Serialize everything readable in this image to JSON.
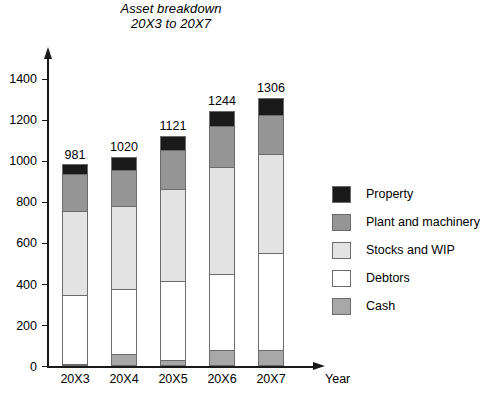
{
  "chart_data": {
    "type": "bar",
    "subtype": "stacked-bar",
    "title": "Asset breakdown\n20X3 to 20X7",
    "title_lines": [
      "Asset breakdown",
      "20X3 to 20X7"
    ],
    "xlabel": "Year",
    "ylabel": "",
    "categories": [
      "20X3",
      "20X4",
      "20X5",
      "20X6",
      "20X7"
    ],
    "ylim": [
      0,
      1500
    ],
    "yticks": [
      0,
      200,
      400,
      600,
      800,
      1000,
      1200,
      1400
    ],
    "ytick_labels": [
      "0",
      "200",
      "400",
      "600",
      "800",
      "1000",
      "1200",
      "1400"
    ],
    "grid": false,
    "legend_position": "right",
    "stack_order_bottom_to_top": [
      "Cash",
      "Debtors",
      "Stocks and WIP",
      "Plant and machinery",
      "Property"
    ],
    "series": [
      {
        "name": "Cash",
        "color": "#a8a8a8",
        "values": [
          5,
          60,
          28,
          77,
          77
        ]
      },
      {
        "name": "Debtors",
        "color": "#ffffff",
        "values": [
          335,
          315,
          385,
          372,
          475
        ]
      },
      {
        "name": "Stocks and WIP",
        "color": "#e3e3e3",
        "values": [
          410,
          405,
          450,
          520,
          482
        ]
      },
      {
        "name": "Plant and machinery",
        "color": "#959595",
        "values": [
          180,
          175,
          190,
          200,
          190
        ]
      },
      {
        "name": "Property",
        "color": "#1a1a1a",
        "values": [
          51,
          65,
          68,
          75,
          82
        ]
      }
    ],
    "bar_totals": [
      981,
      1020,
      1121,
      1244,
      1306
    ],
    "bar_total_labels": [
      "981",
      "1020",
      "1121",
      "1244",
      "1306"
    ]
  },
  "legend": {
    "items": [
      {
        "label": "Property",
        "color": "#1a1a1a"
      },
      {
        "label": "Plant and machinery",
        "color": "#959595"
      },
      {
        "label": "Stocks and WIP",
        "color": "#e3e3e3"
      },
      {
        "label": "Debtors",
        "color": "#ffffff"
      },
      {
        "label": "Cash",
        "color": "#a8a8a8"
      }
    ]
  }
}
